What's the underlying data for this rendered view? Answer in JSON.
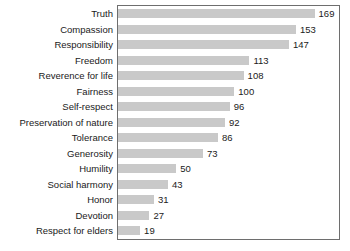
{
  "chart_data": {
    "type": "bar",
    "orientation": "horizontal",
    "title": "",
    "xlabel": "",
    "ylabel": "",
    "xlim": [
      0,
      190
    ],
    "grid": false,
    "legend": false,
    "bar_color": "#c9c9c9",
    "frame_color": "#6e6e6e",
    "text_color": "#1a1a1a",
    "background_color": "#ffffff",
    "categories": [
      "Truth",
      "Compassion",
      "Responsibility",
      "Freedom",
      "Reverence for life",
      "Fairness",
      "Self-respect",
      "Preservation of nature",
      "Tolerance",
      "Generosity",
      "Humility",
      "Social harmony",
      "Honor",
      "Devotion",
      "Respect for elders"
    ],
    "values": [
      169,
      153,
      147,
      113,
      108,
      100,
      96,
      92,
      86,
      73,
      50,
      43,
      31,
      27,
      19
    ],
    "value_labels": [
      "169",
      "153",
      "147",
      "113",
      "108",
      "100",
      "96",
      "92",
      "86",
      "73",
      "50",
      "43",
      "31",
      "27",
      "19"
    ]
  }
}
